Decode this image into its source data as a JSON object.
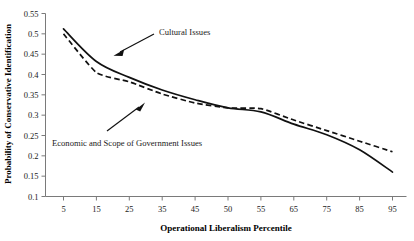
{
  "chart_data": {
    "type": "line",
    "title": "",
    "xlabel": "Operational Liberalism Percentile",
    "ylabel": "Probability of Conservative Identification",
    "categories": [
      "5",
      "15",
      "25",
      "35",
      "45",
      "50",
      "55",
      "65",
      "75",
      "85",
      "95"
    ],
    "x": [
      5,
      15,
      25,
      35,
      45,
      50,
      55,
      65,
      75,
      85,
      95
    ],
    "ylim": [
      0.1,
      0.55
    ],
    "yticks": [
      "0.1",
      "0.15",
      "0.2",
      "0.25",
      "0.3",
      "0.35",
      "0.4",
      "0.45",
      "0.5",
      "0.55"
    ],
    "ytick_values": [
      0.1,
      0.15,
      0.2,
      0.25,
      0.3,
      0.35,
      0.4,
      0.45,
      0.5,
      0.55
    ],
    "grid": false,
    "legend_position": "inline-annotations",
    "series": [
      {
        "name": "Cultural Issues",
        "style": "solid",
        "color": "#111111",
        "values": [
          0.512,
          0.432,
          0.393,
          0.362,
          0.338,
          0.318,
          0.308,
          0.278,
          0.252,
          0.215,
          0.16
        ]
      },
      {
        "name": "Economic and Scope of Government Issues",
        "style": "dashed",
        "color": "#111111",
        "values": [
          0.5,
          0.405,
          0.382,
          0.352,
          0.33,
          0.318,
          0.316,
          0.288,
          0.262,
          0.236,
          0.21
        ]
      }
    ],
    "annotations": [
      {
        "text": "Cultural Issues",
        "target_x": 22,
        "target_y": 0.418
      },
      {
        "text": "Economic and Scope of Government Issues",
        "target_x": 36,
        "target_y": 0.336
      }
    ]
  }
}
